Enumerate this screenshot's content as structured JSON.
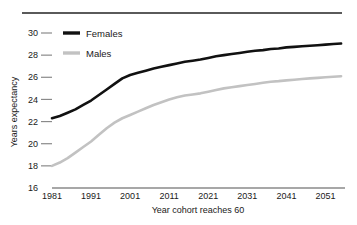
{
  "chart_data": {
    "type": "line",
    "title": "",
    "xlabel": "Year cohort reaches 60",
    "ylabel": "Years expectancy",
    "xlim": [
      1981,
      2056
    ],
    "ylim": [
      16,
      30
    ],
    "xticks": [
      1981,
      1991,
      2001,
      2011,
      2021,
      2031,
      2041,
      2051
    ],
    "xtick_labels": [
      "1981",
      "1991",
      "2001",
      "2011",
      "2021",
      "2031",
      "2041",
      "2051"
    ],
    "yticks": [
      16,
      18,
      20,
      22,
      24,
      26,
      28,
      30
    ],
    "ytick_labels": [
      "16",
      "18",
      "20",
      "22",
      "24",
      "26",
      "28",
      "30"
    ],
    "grid": false,
    "legend_position": "top-left",
    "x": [
      1981,
      1983,
      1985,
      1987,
      1989,
      1991,
      1993,
      1995,
      1997,
      1999,
      2001,
      2003,
      2005,
      2007,
      2009,
      2011,
      2013,
      2015,
      2017,
      2019,
      2021,
      2023,
      2025,
      2027,
      2029,
      2031,
      2033,
      2035,
      2037,
      2039,
      2041,
      2043,
      2045,
      2047,
      2049,
      2051,
      2053,
      2055
    ],
    "series": [
      {
        "name": "Females",
        "color": "#111111",
        "line_width": 2.6,
        "values": [
          22.3,
          22.5,
          22.8,
          23.1,
          23.5,
          23.9,
          24.4,
          24.9,
          25.4,
          25.9,
          26.2,
          26.4,
          26.6,
          26.8,
          26.95,
          27.1,
          27.25,
          27.4,
          27.5,
          27.6,
          27.75,
          27.9,
          28.0,
          28.1,
          28.2,
          28.3,
          28.4,
          28.45,
          28.55,
          28.6,
          28.7,
          28.75,
          28.8,
          28.85,
          28.9,
          28.95,
          29.0,
          29.05
        ]
      },
      {
        "name": "Males",
        "color": "#c2c2c2",
        "line_width": 2.6,
        "values": [
          18.0,
          18.3,
          18.7,
          19.2,
          19.7,
          20.2,
          20.8,
          21.4,
          21.9,
          22.3,
          22.6,
          22.9,
          23.2,
          23.5,
          23.75,
          24.0,
          24.2,
          24.35,
          24.45,
          24.55,
          24.7,
          24.85,
          25.0,
          25.1,
          25.2,
          25.3,
          25.4,
          25.5,
          25.6,
          25.65,
          25.72,
          25.78,
          25.85,
          25.9,
          25.95,
          26.0,
          26.05,
          26.1
        ]
      }
    ]
  },
  "legend": {
    "items": [
      {
        "label": "Females"
      },
      {
        "label": "Males"
      }
    ]
  },
  "axes": {
    "x_title": "Year cohort reaches 60",
    "y_title": "Years expectancy"
  },
  "colors": {
    "females": "#111111",
    "males": "#c2c2c2",
    "axis": "#8a8a8a",
    "rule": "#5a5a5a"
  }
}
